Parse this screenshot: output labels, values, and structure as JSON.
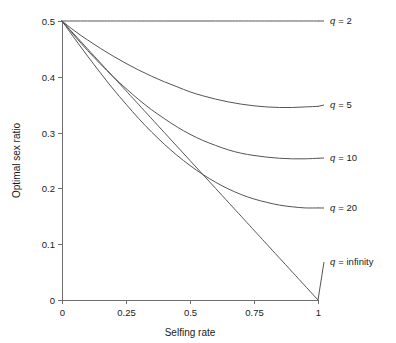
{
  "chart_data": {
    "type": "line",
    "title": "",
    "xlabel": "Selfing rate",
    "ylabel": "Optimal sex ratio",
    "xlim": [
      0,
      1
    ],
    "ylim": [
      0,
      0.5
    ],
    "xticks": [
      "0",
      "0.25",
      "0.5",
      "0.75",
      "1"
    ],
    "xtick_values": [
      0,
      0.25,
      0.5,
      0.75,
      1
    ],
    "yticks": [
      "0",
      "0.1",
      "0.2",
      "0.3",
      "0.4",
      "0.5"
    ],
    "ytick_values": [
      0,
      0.1,
      0.2,
      0.3,
      0.4,
      0.5
    ],
    "grid": false,
    "legend_position": "right-inline-annotations",
    "line_color": "#555555",
    "axis_color": "#6e6e6e",
    "series": [
      {
        "name": "q = 2",
        "param_symbol": "q",
        "param_value": "2",
        "label_prefix": "q",
        "label_suffix": "= 2",
        "x": [
          0,
          0.1,
          0.2,
          0.25,
          0.3,
          0.4,
          0.5,
          0.6,
          0.7,
          0.75,
          0.8,
          0.9,
          1
        ],
        "values": [
          0.5,
          0.5,
          0.5,
          0.5,
          0.5,
          0.5,
          0.5,
          0.5,
          0.5,
          0.5,
          0.5,
          0.5,
          0.5
        ]
      },
      {
        "name": "q = 5",
        "param_symbol": "q",
        "param_value": "5",
        "label_prefix": "q",
        "label_suffix": "= 5",
        "x": [
          0,
          0.05,
          0.1,
          0.15,
          0.2,
          0.25,
          0.3,
          0.35,
          0.4,
          0.45,
          0.5,
          0.55,
          0.6,
          0.65,
          0.7,
          0.75,
          0.8,
          0.85,
          0.9,
          0.95,
          1
        ],
        "values": [
          0.5,
          0.482,
          0.466,
          0.451,
          0.437,
          0.424,
          0.412,
          0.401,
          0.391,
          0.382,
          0.373,
          0.366,
          0.36,
          0.355,
          0.351,
          0.348,
          0.346,
          0.345,
          0.345,
          0.346,
          0.347
        ]
      },
      {
        "name": "q = 10",
        "param_symbol": "q",
        "param_value": "10",
        "label_prefix": "q",
        "label_suffix": "= 10",
        "x": [
          0,
          0.05,
          0.1,
          0.15,
          0.2,
          0.25,
          0.3,
          0.35,
          0.4,
          0.45,
          0.5,
          0.55,
          0.6,
          0.65,
          0.7,
          0.75,
          0.8,
          0.85,
          0.9,
          0.95,
          1
        ],
        "values": [
          0.5,
          0.473,
          0.447,
          0.423,
          0.4,
          0.379,
          0.359,
          0.341,
          0.325,
          0.31,
          0.297,
          0.286,
          0.277,
          0.269,
          0.263,
          0.259,
          0.256,
          0.254,
          0.253,
          0.253,
          0.254
        ]
      },
      {
        "name": "q = 20",
        "param_symbol": "q",
        "param_value": "20",
        "label_prefix": "q",
        "label_suffix": "= 20",
        "x": [
          0,
          0.05,
          0.1,
          0.15,
          0.2,
          0.25,
          0.3,
          0.35,
          0.4,
          0.45,
          0.5,
          0.55,
          0.6,
          0.65,
          0.7,
          0.75,
          0.8,
          0.85,
          0.9,
          0.95,
          1
        ],
        "values": [
          0.5,
          0.468,
          0.437,
          0.407,
          0.378,
          0.351,
          0.325,
          0.301,
          0.279,
          0.259,
          0.241,
          0.225,
          0.211,
          0.199,
          0.189,
          0.181,
          0.175,
          0.17,
          0.167,
          0.165,
          0.165
        ]
      },
      {
        "name": "q = infinity",
        "param_symbol": "q",
        "param_value": "infinity",
        "label_prefix": "q",
        "label_suffix": "= infinity",
        "x": [
          0,
          0.1,
          0.2,
          0.25,
          0.3,
          0.4,
          0.5,
          0.6,
          0.7,
          0.75,
          0.8,
          0.9,
          1
        ],
        "values": [
          0.5,
          0.45,
          0.4,
          0.375,
          0.35,
          0.3,
          0.25,
          0.2,
          0.15,
          0.125,
          0.1,
          0.05,
          0
        ]
      }
    ],
    "annotations": [
      {
        "text": "q = 2",
        "at_x": 1,
        "at_y": 0.5
      },
      {
        "text": "q = 5",
        "at_x": 1,
        "at_y": 0.347
      },
      {
        "text": "q = 10",
        "at_x": 1,
        "at_y": 0.254
      },
      {
        "text": "q = 20",
        "at_x": 1,
        "at_y": 0.165
      },
      {
        "text": "q = infinity",
        "at_x": 1,
        "at_y": 0.0
      }
    ]
  }
}
